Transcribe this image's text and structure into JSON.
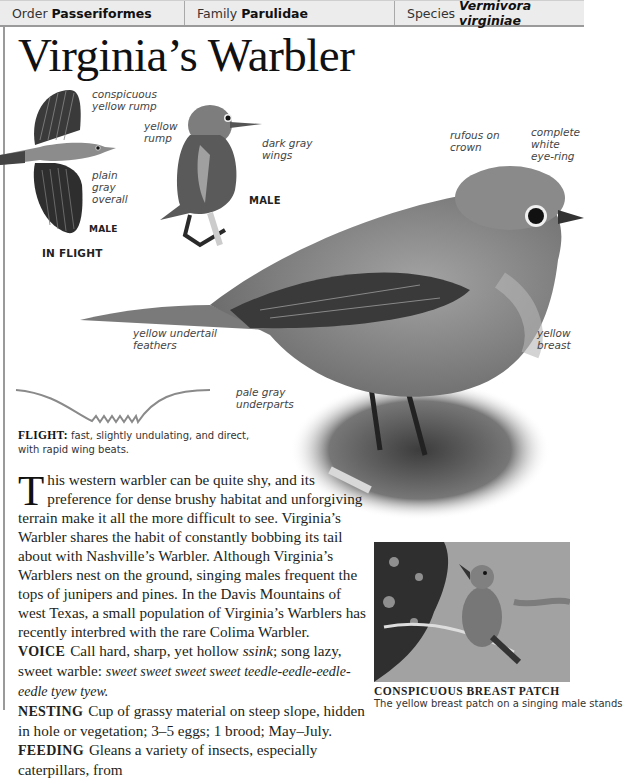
{
  "header": {
    "order_label": "Order",
    "order_value": "Passeriformes",
    "family_label": "Family",
    "family_value": "Parulidae",
    "species_label": "Species",
    "species_value": "Vermivora virginiae"
  },
  "title": "Virginia’s Warbler",
  "flight_bird": {
    "labels": [
      "conspicuous",
      "yellow rump",
      "plain",
      "gray",
      "overall"
    ],
    "sex_tag": "MALE",
    "caption": "IN FLIGHT"
  },
  "perched_male": {
    "labels": [
      "yellow",
      "rump",
      "dark gray",
      "wings"
    ],
    "sex_tag": "MALE"
  },
  "main_bird": {
    "labels": {
      "crown_1": "rufous on",
      "crown_2": "crown",
      "eye_1": "complete",
      "eye_2": "white",
      "eye_3": "eye-ring",
      "undertail_1": "yellow undertail",
      "undertail_2": "feathers",
      "breast_1": "yellow",
      "breast_2": "breast",
      "under_1": "pale gray",
      "under_2": "underparts"
    }
  },
  "flight": {
    "label": "FLIGHT:",
    "text": "fast, slightly undulating, and direct, with rapid wing beats."
  },
  "body": {
    "dropcap": "T",
    "intro": "his western warbler can be quite shy, and its preference for dense brushy habitat and unforgiving terrain make it all the more difficult to see. Virginia’s Warbler shares the habit of constantly bobbing its tail about with Nashville’s Warbler. Although Virginia’s Warblers nest on the ground, singing males frequent the tops of junipers and pines. In the Davis Mountains of west Texas, a small population of Virginia’s Warblers has recently interbred with the rare Colima Warbler.",
    "voice_label": "VOICE",
    "voice_text": "Call hard, sharp, yet hollow ",
    "voice_call": "ssink",
    "voice_text2": "; song lazy, sweet warble:",
    "voice_song": "sweet sweet sweet sweet teedle-eedle-eedle-eedle tyew tyew.",
    "nesting_label": "NESTING",
    "nesting_text": "Cup of grassy material on steep slope, hidden in hole or vegetation; 3–5 eggs; 1 brood; May–July.",
    "feeding_label": "FEEDING",
    "feeding_text": "Gleans a variety of insects, especially caterpillars, from"
  },
  "photo": {
    "caption_title": "CONSPICUOUS BREAST PATCH",
    "caption_text": "The yellow breast patch on a singing male stands"
  }
}
